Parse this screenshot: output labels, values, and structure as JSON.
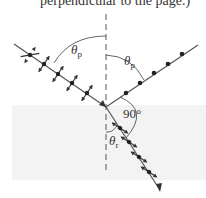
{
  "caption": {
    "text": "perpendicular to the page.)"
  },
  "diagram": {
    "labels": {
      "incident_angle": "θ",
      "incident_angle_sub": "p",
      "reflected_angle": "θ",
      "reflected_angle_sub": "p",
      "right_angle": "90°",
      "refracted_angle": "θ",
      "refracted_angle_sub": "r"
    },
    "colors": {
      "ray": "#555555",
      "dot": "#222222",
      "lower_medium": "#f2f2f2",
      "text": "#333333"
    },
    "rays": [
      {
        "name": "incident",
        "polarization": "mixed (dots and arrows)"
      },
      {
        "name": "reflected",
        "polarization": "dots only (perpendicular)"
      },
      {
        "name": "refracted",
        "polarization": "mostly parallel arrows"
      }
    ]
  }
}
